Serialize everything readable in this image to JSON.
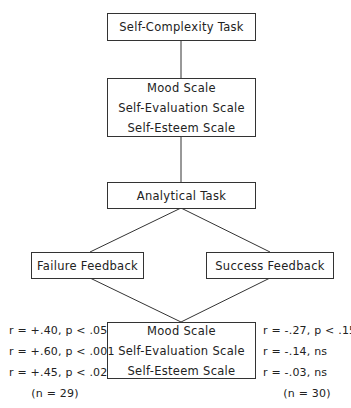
{
  "diagram": {
    "nodes": {
      "top": {
        "lines": [
          "Self-Complexity Task"
        ]
      },
      "pre_measures": {
        "lines": [
          "Mood Scale",
          "Self-Evaluation Scale",
          "Self-Esteem Scale"
        ]
      },
      "analytical": {
        "lines": [
          "Analytical Task"
        ]
      },
      "failure": {
        "lines": [
          "Failure Feedback"
        ]
      },
      "success": {
        "lines": [
          "Success Feedback"
        ]
      },
      "post_measures": {
        "lines": [
          "Mood Scale",
          "Self-Evaluation Scale",
          "Self-Esteem Scale"
        ]
      }
    },
    "stats_failure": {
      "lines": [
        "r = +.40, p < .05",
        "r = +.60, p < .001",
        "r = +.45, p < .02"
      ],
      "n": "(n = 29)"
    },
    "stats_success": {
      "lines": [
        "r = -.27, p < .15",
        "r = -.14, ns",
        "r = -.03, ns"
      ],
      "n": "(n = 30)"
    }
  }
}
